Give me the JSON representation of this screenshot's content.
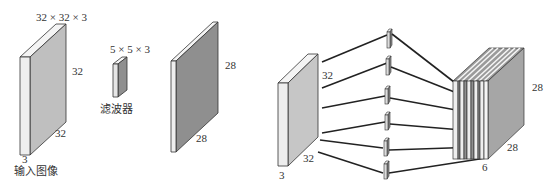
{
  "diagram": {
    "left_panel": {
      "input_image": {
        "dims_label": "32 × 32 × 3",
        "height_label": "32",
        "width_label": "32",
        "depth_label": "3",
        "caption": "输入图像"
      },
      "filter": {
        "dims_label": "5 × 5 × 3",
        "caption": "滤波器"
      },
      "activation_map": {
        "height_label": "28",
        "width_label": "28"
      }
    },
    "right_panel": {
      "input_volume": {
        "height_label": "32",
        "width_label": "32",
        "depth_label": "3"
      },
      "filter_count": 6,
      "output_volume": {
        "height_label": "28",
        "width_label": "28",
        "depth_label": "6"
      }
    },
    "colors": {
      "front_face": "#eeeeee",
      "side_face": "#bdbdbd",
      "top_face": "#f2f2f2",
      "dark_face": "#8f8f8f",
      "stroke": "#333333",
      "connector": "#222222"
    }
  }
}
